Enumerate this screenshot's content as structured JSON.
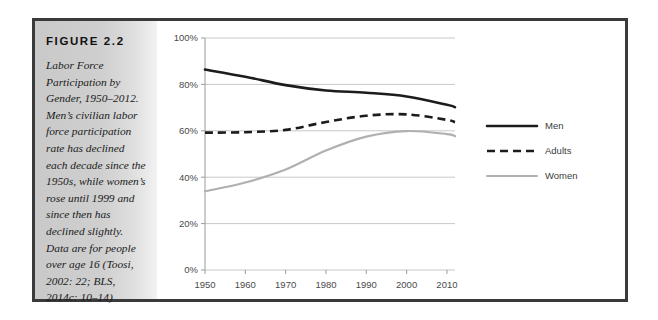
{
  "figure": {
    "label": "FIGURE 2.2",
    "caption": "Labor Force Participation by Gender, 1950–2012. Men’s civilian labor force participation rate has declined each decade since the 1950s, while women’s rose until 1999 and since then has declined slightly. Data are for people over age 16 (Toosi, 2002: 22; BLS, 2014c: 10–14)"
  },
  "colors": {
    "men": "#1c1c1c",
    "adults": "#1c1c1c",
    "women": "#b0b0b0",
    "grid": "#c8c8c8",
    "frame": "#3a3a3a",
    "panel": "#cfcfcf"
  },
  "chart_data": {
    "type": "line",
    "title": "",
    "xlabel": "",
    "ylabel": "",
    "xlim": [
      1950,
      2012
    ],
    "ylim": [
      0,
      100
    ],
    "grid": true,
    "legend_position": "right",
    "xticks": [
      1950,
      1960,
      1970,
      1980,
      1990,
      2000,
      2010
    ],
    "xtick_labels": [
      "1950",
      "1960",
      "1970",
      "1980",
      "1990",
      "2000",
      "2010"
    ],
    "yticks": [
      0,
      20,
      40,
      60,
      80,
      100
    ],
    "ytick_labels": [
      "0%",
      "20%",
      "40%",
      "60%",
      "80%",
      "100%"
    ],
    "x": [
      1950,
      1960,
      1970,
      1980,
      1990,
      2000,
      2010,
      2012
    ],
    "series": [
      {
        "name": "Men",
        "style": "solid",
        "color": "#1c1c1c",
        "values": [
          86.4,
          83.3,
          79.7,
          77.4,
          76.4,
          74.8,
          71.2,
          70.2
        ]
      },
      {
        "name": "Adults",
        "style": "dashed",
        "color": "#1c1c1c",
        "values": [
          59.2,
          59.4,
          60.4,
          63.8,
          66.5,
          67.1,
          64.7,
          63.7
        ]
      },
      {
        "name": "Women",
        "style": "solid",
        "color": "#b0b0b0",
        "values": [
          33.9,
          37.7,
          43.3,
          51.5,
          57.5,
          59.9,
          58.6,
          57.7
        ]
      }
    ]
  }
}
